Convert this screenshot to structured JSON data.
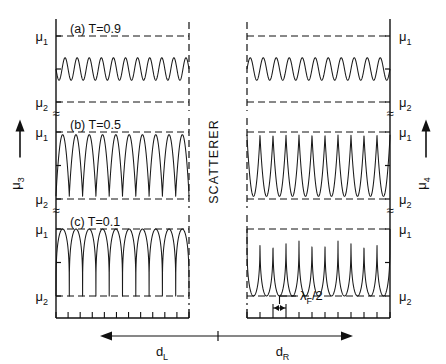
{
  "figure": {
    "type": "line",
    "axis_left_label": "μ",
    "axis_left_sub": "3",
    "axis_right_label": "μ",
    "axis_right_sub": "4",
    "divider_label": "SCATTERER",
    "break_glyph": "≈",
    "level_hi_label": "μ",
    "level_hi_sub": "1",
    "level_lo_label": "μ",
    "level_lo_sub": "2",
    "dist_left_label": "d",
    "dist_left_sub": "L",
    "dist_right_label": "d",
    "dist_right_sub": "R",
    "wavelength_label": "λ",
    "wavelength_sub": "F",
    "wavelength_tail": "/2",
    "n_bottom_ticks": 11
  },
  "panels": [
    {
      "id": "a",
      "label": "(a) T=0.9",
      "tag": "(a)",
      "transmission": 0.9,
      "left": {
        "cycles": 11,
        "amplitude": 0.17,
        "baseline": 0.52,
        "shape": "sine",
        "phase": 0.5
      },
      "right": {
        "cycles": 11,
        "amplitude": 0.17,
        "baseline": 0.52,
        "shape": "sine",
        "phase": 0.0
      }
    },
    {
      "id": "b",
      "label": "(b) T=0.5",
      "tag": "(b)",
      "transmission": 0.5,
      "left": {
        "cycles": 10,
        "amplitude": 0.46,
        "baseline": 0.5,
        "shape": "sharp-down",
        "phase": 0.5
      },
      "right": {
        "cycles": 11,
        "amplitude": 0.46,
        "baseline": 0.5,
        "shape": "sharp-up",
        "phase": 0.0
      }
    },
    {
      "id": "c",
      "label": "(c) T=0.1",
      "tag": "(c)",
      "transmission": 0.1,
      "left": {
        "cycles": 10,
        "amplitude": 0.5,
        "baseline": 0.5,
        "shape": "plateau-down",
        "phase": 0.5
      },
      "right": {
        "cycles": 11,
        "amplitude": 0.5,
        "baseline": 0.5,
        "shape": "spike-up",
        "phase": 0.0
      }
    }
  ],
  "chart_data": {
    "type": "line",
    "title": "",
    "xlabel": "position along left lead (d_L) and right lead (d_R)",
    "ylabel": "local chemical potential μ3 (left) / μ4 (right)",
    "ylim": [
      0,
      1
    ],
    "ytick_labels": [
      "μ2",
      "μ1"
    ],
    "ytick_values": [
      0,
      1
    ],
    "grid": false,
    "legend": "none",
    "annotations": [
      "SCATTERER",
      "λF/2",
      "dL",
      "dR",
      "≈"
    ],
    "series": [
      {
        "name": "(a) T=0.9 left",
        "panel": "a",
        "side": "left",
        "description": "small-amplitude sinusoidal Friedel oscillation about mid-level",
        "cycles": 11,
        "min": 0.35,
        "max": 0.69,
        "mean": 0.52
      },
      {
        "name": "(a) T=0.9 right",
        "panel": "a",
        "side": "right",
        "description": "small-amplitude sinusoidal Friedel oscillation about mid-level",
        "cycles": 11,
        "min": 0.35,
        "max": 0.69,
        "mean": 0.52
      },
      {
        "name": "(b) T=0.5 left",
        "panel": "b",
        "side": "left",
        "description": "large oscillation, rounded maxima near mu1, sharp minima near mu2",
        "cycles": 10,
        "min": 0.04,
        "max": 0.96,
        "mean": 0.5
      },
      {
        "name": "(b) T=0.5 right",
        "panel": "b",
        "side": "right",
        "description": "large oscillation, sharp maxima near mu1, rounded minima near mu2",
        "cycles": 11,
        "min": 0.04,
        "max": 0.96,
        "mean": 0.5
      },
      {
        "name": "(c) T=0.1 left",
        "panel": "c",
        "side": "left",
        "description": "full-range plateaus at mu1 with narrow deep notches to mu2",
        "cycles": 10,
        "min": 0.0,
        "max": 1.0,
        "mean": 0.62
      },
      {
        "name": "(c) T=0.1 right",
        "panel": "c",
        "side": "right",
        "description": "flat baseline at mu2 with narrow tall spikes up to mu1",
        "cycles": 11,
        "min": 0.0,
        "max": 1.0,
        "mean": 0.22
      }
    ]
  }
}
